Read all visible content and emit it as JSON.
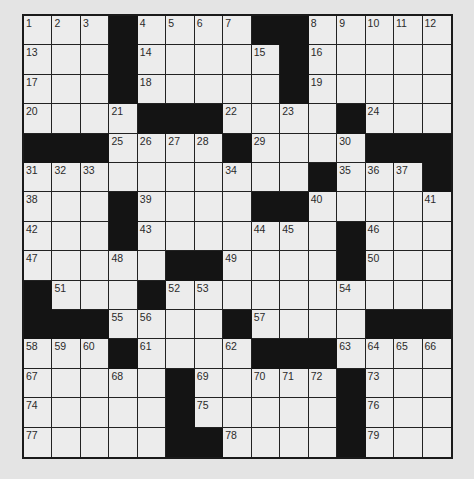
{
  "puzzle": {
    "rows": 15,
    "cols": 15,
    "colors": {
      "background": "#e4e4e4",
      "cell": "#ececec",
      "block": "#141414",
      "line": "#222222",
      "number": "#2a2a2a"
    },
    "grid": [
      [
        "1",
        "2",
        "3",
        "#",
        "4",
        "5",
        "6",
        "7",
        "#",
        "#",
        "8",
        "9",
        "10",
        "11",
        "12"
      ],
      [
        "13",
        "",
        "",
        "#",
        "14",
        "",
        "",
        "",
        "15",
        "#",
        "16",
        "",
        "",
        "",
        ""
      ],
      [
        "17",
        "",
        "",
        "#",
        "18",
        "",
        "",
        "",
        "",
        "#",
        "19",
        "",
        "",
        "",
        ""
      ],
      [
        "20",
        "",
        "",
        "21",
        "#",
        "#",
        "#",
        "22",
        "",
        "23",
        "",
        "#",
        "24",
        "",
        ""
      ],
      [
        "#",
        "#",
        "#",
        "25",
        "26",
        "27",
        "28",
        "#",
        "29",
        "",
        "",
        "30",
        "#",
        "#",
        "#"
      ],
      [
        "31",
        "32",
        "33",
        "",
        "",
        "",
        "",
        "34",
        "",
        "",
        "#",
        "35",
        "36",
        "37",
        "#"
      ],
      [
        "38",
        "",
        "",
        "#",
        "39",
        "",
        "",
        "",
        "#",
        "#",
        "40",
        "",
        "",
        "",
        "41"
      ],
      [
        "42",
        "",
        "",
        "#",
        "43",
        "",
        "",
        "",
        "44",
        "45",
        "",
        "#",
        "46",
        "",
        ""
      ],
      [
        "47",
        "",
        "",
        "48",
        "",
        "#",
        "#",
        "49",
        "",
        "",
        "",
        "#",
        "50",
        "",
        ""
      ],
      [
        "#",
        "51",
        "",
        "",
        "#",
        "52",
        "53",
        "",
        "",
        "",
        "",
        "54",
        "",
        "",
        ""
      ],
      [
        "#",
        "#",
        "#",
        "55",
        "56",
        "",
        "",
        "#",
        "57",
        "",
        "",
        "",
        "#",
        "#",
        "#"
      ],
      [
        "58",
        "59",
        "60",
        "#",
        "61",
        "",
        "",
        "62",
        "#",
        "#",
        "#",
        "63",
        "64",
        "65",
        "66"
      ],
      [
        "67",
        "",
        "",
        "68",
        "",
        "#",
        "69",
        "",
        "70",
        "71",
        "72",
        "#",
        "73",
        "",
        ""
      ],
      [
        "74",
        "",
        "",
        "",
        "",
        "#",
        "75",
        "",
        "",
        "",
        "",
        "#",
        "76",
        "",
        ""
      ],
      [
        "77",
        "",
        "",
        "",
        "",
        "#",
        "#",
        "78",
        "",
        "",
        "",
        "#",
        "79",
        "",
        ""
      ]
    ]
  }
}
